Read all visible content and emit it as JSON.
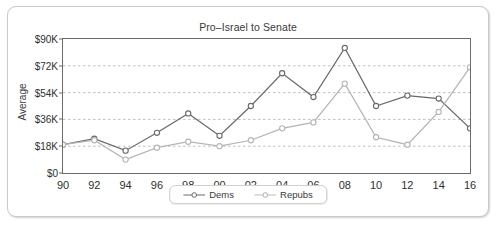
{
  "chart_data": {
    "type": "line",
    "title": "Pro–Israel to Senate",
    "xlabel": "",
    "ylabel": "Average",
    "categories": [
      "90",
      "92",
      "94",
      "96",
      "98",
      "00",
      "02",
      "04",
      "06",
      "08",
      "10",
      "12",
      "14",
      "16"
    ],
    "ylim": [
      0,
      90000
    ],
    "ytick_values": [
      0,
      18000,
      36000,
      54000,
      72000,
      90000
    ],
    "ytick_labels": [
      "$0",
      "$18K",
      "$36K",
      "$54K",
      "$72K",
      "$90K"
    ],
    "grid": "horizontal-dashed",
    "legend_position": "bottom-center",
    "series": [
      {
        "name": "Dems",
        "color": "#6a6a6a",
        "values": [
          19000,
          23000,
          15000,
          27000,
          40000,
          25000,
          45000,
          67000,
          51000,
          84000,
          45000,
          52000,
          50000,
          30000
        ]
      },
      {
        "name": "Repubs",
        "color": "#b5b5b5",
        "values": [
          19000,
          22000,
          9000,
          17000,
          21000,
          18000,
          22000,
          30000,
          34000,
          60000,
          24000,
          19000,
          41000,
          71000
        ]
      }
    ]
  },
  "legend": {
    "items": [
      {
        "label": "Dems",
        "marker": "circle-open-icon"
      },
      {
        "label": "Repubs",
        "marker": "circle-open-icon"
      }
    ]
  }
}
